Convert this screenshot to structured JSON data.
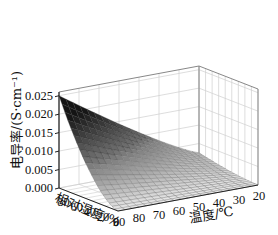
{
  "chart_data": {
    "type": "surface3d",
    "title": "",
    "zlabel": "电导率/(S·cm⁻¹)",
    "xlabel": "温度/℃",
    "ylabel": "相对湿度/%",
    "z_ticks": [
      "0.000",
      "0.005",
      "0.010",
      "0.015",
      "0.020",
      "0.025"
    ],
    "z_tick_values": [
      0.0,
      0.005,
      0.01,
      0.015,
      0.02,
      0.025
    ],
    "x_ticks": [
      "90",
      "80",
      "70",
      "60",
      "50",
      "40",
      "30",
      "20"
    ],
    "x_tick_values": [
      90,
      80,
      70,
      60,
      50,
      40,
      30,
      20
    ],
    "y_ticks": [
      "80",
      "60",
      "40",
      "20",
      "0"
    ],
    "y_tick_values": [
      80,
      60,
      40,
      20,
      0
    ],
    "xlim": [
      20,
      90
    ],
    "ylim": [
      0,
      90
    ],
    "zlim": [
      0,
      0.026
    ],
    "grid": true,
    "colormap": "gray (dark = high conductivity)",
    "surface_description": "Conductivity rises with both temperature and relative humidity; max ≈0.025 S/cm at 90 ℃ / ~90 %RH, near 0 at low RH or low temperature.",
    "surface_samples": {
      "temperature": [
        20,
        30,
        40,
        50,
        60,
        70,
        80,
        90
      ],
      "humidity": [
        0,
        20,
        40,
        60,
        80,
        90
      ],
      "conductivity": [
        [
          0.0,
          0.0,
          0.0,
          0.0,
          0.0,
          0.0,
          0.0,
          0.0
        ],
        [
          0.0002,
          0.0004,
          0.0006,
          0.0008,
          0.001,
          0.0012,
          0.0014,
          0.0016
        ],
        [
          0.0006,
          0.0012,
          0.0018,
          0.0025,
          0.0032,
          0.004,
          0.0048,
          0.0056
        ],
        [
          0.0012,
          0.0024,
          0.0037,
          0.0051,
          0.0066,
          0.0082,
          0.0098,
          0.0115
        ],
        [
          0.002,
          0.004,
          0.0062,
          0.0086,
          0.011,
          0.0136,
          0.0163,
          0.0192
        ],
        [
          0.0025,
          0.005,
          0.0077,
          0.0106,
          0.0137,
          0.017,
          0.0205,
          0.025
        ]
      ]
    }
  }
}
